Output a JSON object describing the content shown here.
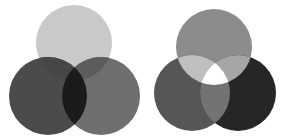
{
  "diagrams": [
    {
      "id": "subtractive",
      "circles": {
        "top": {
          "cx": 74,
          "cy": 43,
          "r": 38,
          "fill": "#c9c9c9"
        },
        "left": {
          "cx": 48,
          "cy": 96,
          "r": 39,
          "fill": "#4b4b4b"
        },
        "right": {
          "cx": 101,
          "cy": 96,
          "r": 39,
          "fill": "#6f6f6f"
        }
      },
      "overlaps": {
        "top_left": "#464646",
        "top_right": "#5c5c5c",
        "left_right": "#1b1b1b",
        "center": "#1b1b1b"
      }
    },
    {
      "id": "additive",
      "circles": {
        "top": {
          "cx": 214,
          "cy": 47,
          "r": 38,
          "fill": "#8c8c8c"
        },
        "left": {
          "cx": 192,
          "cy": 93,
          "r": 38,
          "fill": "#565656"
        },
        "right": {
          "cx": 238,
          "cy": 93,
          "r": 38,
          "fill": "#262626"
        }
      },
      "overlaps": {
        "top_left": "#bfbfbf",
        "top_right": "#a6a6a6",
        "left_right": "#737373",
        "center": "#ffffff"
      }
    }
  ]
}
